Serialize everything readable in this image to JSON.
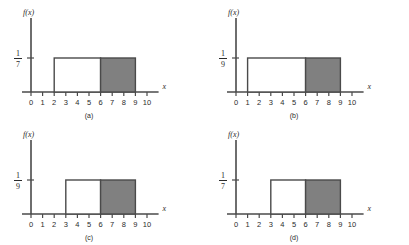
{
  "figure": {
    "background_color": "#ffffff",
    "line_color": "#4a4a4a",
    "shade_color": "#808080",
    "axis_x_label": "x",
    "axis_y_label": "f(x)"
  },
  "chart_data": [
    {
      "type": "area",
      "panel_label": "(a)",
      "title": "",
      "xlabel": "x",
      "ylabel": "f(x)",
      "xlim": [
        0,
        11
      ],
      "ylim": [
        0,
        1
      ],
      "xticks": [
        "0",
        "1",
        "2",
        "3",
        "4",
        "5",
        "6",
        "7",
        "8",
        "9",
        "10"
      ],
      "ytick_labels": [
        {
          "numerator": "1",
          "denominator": "7"
        }
      ],
      "density_height_label": "1/7",
      "support": [
        2,
        9
      ],
      "shaded_region": [
        6,
        9
      ],
      "grid": false,
      "legend": "none"
    },
    {
      "type": "area",
      "panel_label": "(b)",
      "title": "",
      "xlabel": "x",
      "ylabel": "f(x)",
      "xlim": [
        0,
        11
      ],
      "ylim": [
        0,
        1
      ],
      "xticks": [
        "0",
        "1",
        "2",
        "3",
        "4",
        "5",
        "6",
        "7",
        "8",
        "9",
        "10"
      ],
      "ytick_labels": [
        {
          "numerator": "1",
          "denominator": "9"
        }
      ],
      "density_height_label": "1/9",
      "support": [
        1,
        9
      ],
      "shaded_region": [
        6,
        9
      ],
      "grid": false,
      "legend": "none"
    },
    {
      "type": "area",
      "panel_label": "(c)",
      "title": "",
      "xlabel": "x",
      "ylabel": "f(x)",
      "xlim": [
        0,
        11
      ],
      "ylim": [
        0,
        1
      ],
      "xticks": [
        "0",
        "1",
        "2",
        "3",
        "4",
        "5",
        "6",
        "7",
        "8",
        "9",
        "10"
      ],
      "ytick_labels": [
        {
          "numerator": "1",
          "denominator": "9"
        }
      ],
      "density_height_label": "1/9",
      "support": [
        3,
        9
      ],
      "shaded_region": [
        6,
        9
      ],
      "grid": false,
      "legend": "none"
    },
    {
      "type": "area",
      "panel_label": "(d)",
      "title": "",
      "xlabel": "x",
      "ylabel": "f(x)",
      "xlim": [
        0,
        11
      ],
      "ylim": [
        0,
        1
      ],
      "xticks": [
        "0",
        "1",
        "2",
        "3",
        "4",
        "5",
        "6",
        "7",
        "8",
        "9",
        "10"
      ],
      "ytick_labels": [
        {
          "numerator": "1",
          "denominator": "7"
        }
      ],
      "density_height_label": "1/7",
      "support": [
        3,
        9
      ],
      "shaded_region": [
        6,
        9
      ],
      "grid": false,
      "legend": "none"
    }
  ]
}
